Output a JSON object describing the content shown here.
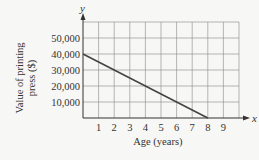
{
  "chart_data": {
    "type": "line",
    "title": "",
    "xlabel": "Age (years)",
    "ylabel": "Value of printing press ($)",
    "x_axis_symbol": "x",
    "y_axis_symbol": "y",
    "x_ticks": [
      "1",
      "2",
      "3",
      "4",
      "5",
      "6",
      "7",
      "8",
      "9"
    ],
    "y_ticks": [
      "10,000",
      "20,000",
      "30,000",
      "40,000",
      "50,000"
    ],
    "xlim": [
      0,
      10
    ],
    "ylim": [
      0,
      60000
    ],
    "grid": true,
    "series": [
      {
        "name": "Value",
        "x": [
          0,
          8
        ],
        "y": [
          40000,
          0
        ]
      }
    ]
  },
  "labels": {
    "ylabel_line1": "Value of  printing",
    "ylabel_line2": "press ($)",
    "xlabel": "Age (years)",
    "x_symbol": "x",
    "y_symbol": "y"
  }
}
